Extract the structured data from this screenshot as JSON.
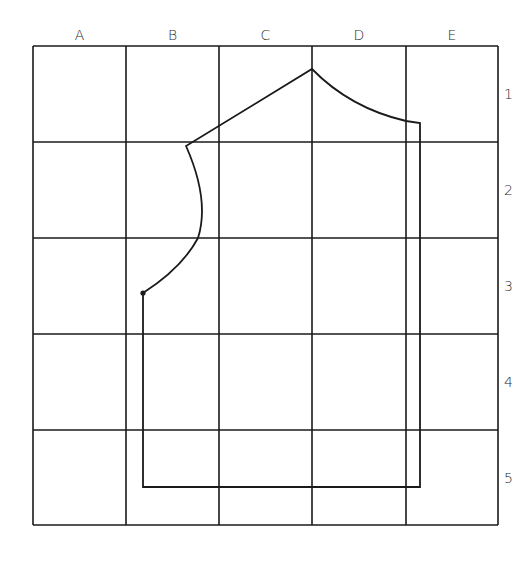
{
  "diagram": {
    "type": "pattern-grid",
    "columns": [
      "A",
      "B",
      "C",
      "D",
      "E"
    ],
    "rows": [
      "1",
      "2",
      "3",
      "4",
      "5"
    ],
    "grid": {
      "x_lines": [
        33,
        126,
        219,
        312,
        406,
        498
      ],
      "y_lines": [
        46,
        142,
        238,
        334,
        430,
        525
      ],
      "stroke": "#1a1a1a"
    },
    "outline": {
      "description": "bodice pattern piece outline",
      "stroke": "#1a1a1a"
    }
  }
}
